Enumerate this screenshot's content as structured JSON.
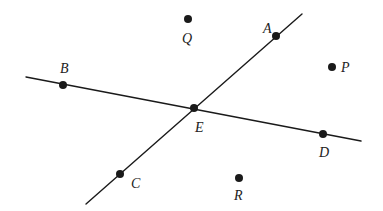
{
  "diagram": {
    "type": "geometry-intersecting-lines",
    "lines": [
      {
        "name": "line-BD",
        "x1": 26,
        "y1": 77,
        "x2": 361,
        "y2": 141,
        "through": [
          "B",
          "E",
          "D"
        ]
      },
      {
        "name": "line-AC",
        "x1": 302,
        "y1": 14,
        "x2": 86,
        "y2": 204,
        "through": [
          "A",
          "E",
          "C"
        ]
      }
    ],
    "points": [
      {
        "id": "A",
        "label": "A",
        "x": 276,
        "y": 36,
        "lx": 263,
        "ly": 33,
        "on_line": true
      },
      {
        "id": "B",
        "label": "B",
        "x": 63,
        "y": 85,
        "lx": 60,
        "ly": 73,
        "on_line": true
      },
      {
        "id": "C",
        "label": "C",
        "x": 120,
        "y": 174,
        "lx": 131,
        "ly": 188,
        "on_line": true
      },
      {
        "id": "D",
        "label": "D",
        "x": 323,
        "y": 134,
        "lx": 319,
        "ly": 157,
        "on_line": true
      },
      {
        "id": "E",
        "label": "E",
        "x": 194,
        "y": 108,
        "lx": 195,
        "ly": 132,
        "on_line": true
      },
      {
        "id": "P",
        "label": "P",
        "x": 332,
        "y": 67,
        "lx": 341,
        "ly": 72,
        "on_line": false
      },
      {
        "id": "Q",
        "label": "Q",
        "x": 188,
        "y": 19,
        "lx": 182,
        "ly": 43,
        "on_line": false
      },
      {
        "id": "R",
        "label": "R",
        "x": 239,
        "y": 178,
        "lx": 234,
        "ly": 200,
        "on_line": false
      }
    ],
    "point_radius": 4,
    "color": "#1a1a1a"
  }
}
